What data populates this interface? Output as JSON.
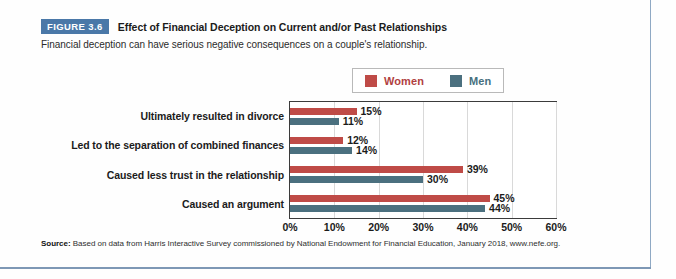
{
  "figure": {
    "badge": "FIGURE 3.6",
    "title": "Effect of Financial Deception on Current and/or Past Relationships",
    "subtitle": "Financial deception can have serious negative consequences on a couple's relationship."
  },
  "legend": {
    "women_label": "Women",
    "men_label": "Men",
    "women_color": "#bf4b47",
    "men_color": "#4b707f"
  },
  "source": {
    "label": "Source:",
    "text": " Based on data from Harris Interactive Survey commissioned by National Endowment for Financial Education, January 2018, www.nefe.org."
  },
  "chart_data": {
    "type": "bar",
    "orientation": "horizontal",
    "title": "Effect of Financial Deception on Current and/or Past Relationships",
    "xlabel": "",
    "ylabel": "",
    "xlim": [
      0,
      60
    ],
    "xticks": [
      "0%",
      "10%",
      "20%",
      "30%",
      "40%",
      "50%",
      "60%"
    ],
    "xtick_values": [
      0,
      10,
      20,
      30,
      40,
      50,
      60
    ],
    "grid": "vertical",
    "legend_position": "top-center",
    "categories": [
      "Ultimately resulted in divorce",
      "Led to the separation of combined finances",
      "Caused less trust in the relationship",
      "Caused an argument"
    ],
    "series": [
      {
        "name": "Women",
        "color": "#bf4b47",
        "values": [
          15,
          12,
          39,
          45
        ],
        "labels": [
          "15%",
          "12%",
          "39%",
          "45%"
        ]
      },
      {
        "name": "Men",
        "color": "#4b707f",
        "values": [
          11,
          14,
          30,
          44
        ],
        "labels": [
          "11%",
          "14%",
          "30%",
          "44%"
        ]
      }
    ]
  }
}
